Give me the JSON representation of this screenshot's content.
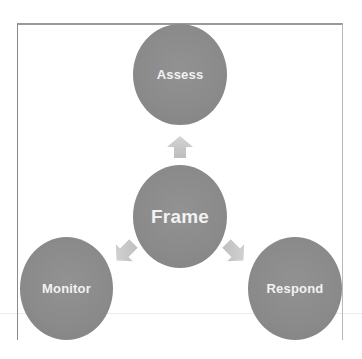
{
  "diagram": {
    "type": "cycle",
    "center": {
      "label": "Frame"
    },
    "nodes": [
      {
        "id": "assess",
        "label": "Assess",
        "position": "top"
      },
      {
        "id": "monitor",
        "label": "Monitor",
        "position": "bottom-left"
      },
      {
        "id": "respond",
        "label": "Respond",
        "position": "bottom-right"
      }
    ],
    "arrows": [
      {
        "from": "Frame",
        "to": "Assess",
        "direction": "up"
      },
      {
        "from": "Frame",
        "to": "Monitor",
        "direction": "down-left"
      },
      {
        "from": "Frame",
        "to": "Respond",
        "direction": "down-right"
      }
    ],
    "colors": {
      "node_fill": "#8c8c8c",
      "node_text": "#f2f2f2",
      "arrow_fill": "#c8c8c8",
      "border": "#9a9a9a"
    }
  }
}
